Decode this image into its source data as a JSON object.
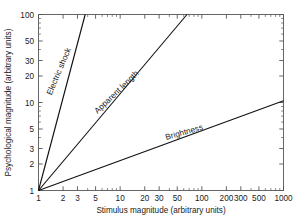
{
  "chart_data": {
    "type": "line",
    "title": "",
    "xlabel": "Stimulus magnitude (arbitrary units)",
    "ylabel": "Psychological magnitude (arbitrary units)",
    "xscale": "log",
    "yscale": "log",
    "xlim": [
      1,
      1000
    ],
    "ylim": [
      1,
      100
    ],
    "grid": false,
    "legend_position": "inline-labels",
    "xticks": [
      1,
      2,
      3,
      5,
      10,
      20,
      30,
      50,
      100,
      200,
      300,
      500,
      1000
    ],
    "xticklabels": [
      "1",
      "2",
      "3",
      "5",
      "10",
      "20",
      "30",
      "50",
      "100",
      "200",
      "300",
      "500",
      "1000"
    ],
    "yticks": [
      1,
      2,
      3,
      5,
      10,
      20,
      30,
      50,
      100
    ],
    "yticklabels": [
      "1",
      "2",
      "3",
      "5",
      "10",
      "20",
      "30",
      "50",
      "100"
    ],
    "series": [
      {
        "name": "Electric shock",
        "label": "Electric shock",
        "exponent": 3.5,
        "x": [
          1,
          3.728
        ],
        "y": [
          1,
          100
        ],
        "color": "#111111"
      },
      {
        "name": "Apparent length",
        "label": "Apparent length",
        "exponent": 1.1,
        "x": [
          1,
          65.79
        ],
        "y": [
          1,
          100
        ],
        "color": "#111111"
      },
      {
        "name": "Brightness",
        "label": "Brightness",
        "exponent": 0.34,
        "x": [
          1,
          1000
        ],
        "y": [
          1,
          10.48
        ],
        "color": "#111111"
      }
    ],
    "annotations": [
      {
        "text": "Electric shock",
        "x": 1.9,
        "y": 22,
        "rotation": -67
      },
      {
        "text": "Apparent length",
        "x": 9.5,
        "y": 12.5,
        "rotation": -44
      },
      {
        "text": "Brightness",
        "x": 62,
        "y": 4.3,
        "rotation": -16
      }
    ]
  },
  "axes": {
    "x_title": "Stimulus magnitude (arbitrary units)",
    "y_title": "Psychological magnitude (arbitrary units)",
    "x_tick_labels": [
      "1",
      "2",
      "3",
      "5",
      "10",
      "20",
      "30",
      "50",
      "100",
      "200",
      "300",
      "500",
      "1000"
    ],
    "y_tick_labels": [
      "1",
      "2",
      "3",
      "5",
      "10",
      "20",
      "30",
      "50",
      "100"
    ]
  },
  "curves": {
    "electric_shock": "Electric shock",
    "apparent_length": "Apparent length",
    "brightness": "Brightness"
  },
  "colors": {
    "line": "#111111",
    "spine": "#555555",
    "text": "#1a1a1a",
    "background": "#ffffff"
  }
}
